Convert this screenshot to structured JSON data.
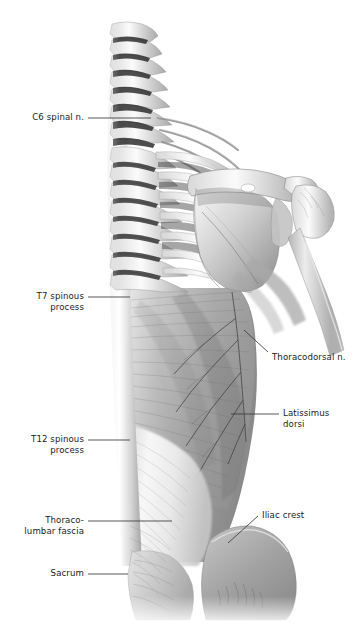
{
  "figure": {
    "kind": "anatomical-illustration",
    "region": "posterior trunk, superficial back",
    "view": "posterior",
    "background_color": "#ffffff",
    "text_color": "#1a1a1a",
    "leader_color": "#3a3a3a",
    "width": 361,
    "height": 626
  },
  "labels": [
    {
      "id": "c6-spinal-n",
      "text": "C6 spinal n.",
      "align": "right",
      "x": 22,
      "y": 112,
      "w": 62,
      "leader": {
        "type": "line",
        "x1": 88,
        "y1": 118,
        "x2": 151,
        "y2": 118
      }
    },
    {
      "id": "t7-spinous-process",
      "text": "T7 spinous\nprocess",
      "align": "right",
      "x": 22,
      "y": 291,
      "w": 62,
      "leader": {
        "type": "line",
        "x1": 88,
        "y1": 297,
        "x2": 130,
        "y2": 297
      }
    },
    {
      "id": "t12-spinous-process",
      "text": "T12 spinous\nprocess",
      "align": "right",
      "x": 16,
      "y": 434,
      "w": 68,
      "leader": {
        "type": "line",
        "x1": 88,
        "y1": 440,
        "x2": 130,
        "y2": 440
      }
    },
    {
      "id": "thoracolumbar-fascia",
      "text": "Thoraco-\nlumbar fascia",
      "align": "right",
      "x": 12,
      "y": 515,
      "w": 72,
      "leader": {
        "type": "line",
        "x1": 88,
        "y1": 521,
        "x2": 172,
        "y2": 521
      }
    },
    {
      "id": "sacrum",
      "text": "Sacrum",
      "align": "right",
      "x": 30,
      "y": 568,
      "w": 54,
      "leader": {
        "type": "line",
        "x1": 88,
        "y1": 574,
        "x2": 128,
        "y2": 574
      }
    },
    {
      "id": "thoracodorsal-n",
      "text": "Thoracodorsal n.",
      "align": "left",
      "x": 272,
      "y": 352,
      "w": 86,
      "leader": {
        "type": "diag",
        "x1": 268,
        "y1": 352,
        "x2": 244,
        "y2": 330
      }
    },
    {
      "id": "latissimus-dorsi",
      "text": "Latissimus\ndorsi",
      "align": "left",
      "x": 283,
      "y": 408,
      "w": 72,
      "leader": {
        "type": "line",
        "x1": 231,
        "y1": 414,
        "x2": 279,
        "y2": 414
      }
    },
    {
      "id": "iliac-crest",
      "text": "Iliac crest",
      "align": "left",
      "x": 262,
      "y": 510,
      "w": 62,
      "leader": {
        "type": "diag",
        "x1": 258,
        "y1": 516,
        "x2": 228,
        "y2": 543
      }
    }
  ],
  "structures": [
    {
      "id": "cervical-vertebrae",
      "name": "Cervical vertebral column"
    },
    {
      "id": "thoracic-vertebrae",
      "name": "Thoracic vertebral column"
    },
    {
      "id": "spinal-nerve-roots",
      "name": "Spinal nerve roots"
    },
    {
      "id": "ribs",
      "name": "Ribs"
    },
    {
      "id": "scapula",
      "name": "Scapula"
    },
    {
      "id": "humerus",
      "name": "Humerus"
    },
    {
      "id": "latissimus-dorsi-muscle",
      "name": "Latissimus dorsi muscle"
    },
    {
      "id": "thoracolumbar-fascia-sheet",
      "name": "Thoracolumbar fascia"
    },
    {
      "id": "ilium",
      "name": "Ilium / iliac crest"
    },
    {
      "id": "sacrum-bone",
      "name": "Sacrum"
    },
    {
      "id": "gluteal-mass",
      "name": "Gluteal region"
    }
  ]
}
